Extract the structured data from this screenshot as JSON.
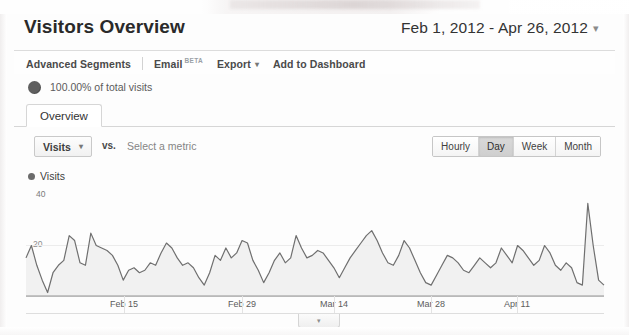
{
  "header": {
    "title": "Visitors Overview",
    "date_range": "Feb 1, 2012 - Apr 26, 2012",
    "date_caret": "▾"
  },
  "toolbar": {
    "advanced_segments": "Advanced Segments",
    "email": "Email",
    "email_badge": "BETA",
    "export": "Export",
    "export_caret": "▾",
    "add_to_dashboard": "Add to Dashboard"
  },
  "segment": {
    "icon": "pie-chart-icon",
    "label": "100.00% of total visits"
  },
  "tabs": [
    {
      "label": "Overview",
      "active": true
    }
  ],
  "metric_row": {
    "metric_button": "Visits",
    "metric_caret": "▾",
    "vs_label": "vs.",
    "select_metric_placeholder": "Select a metric"
  },
  "granularity": {
    "options": [
      "Hourly",
      "Day",
      "Week",
      "Month"
    ],
    "selected": "Day"
  },
  "legend": {
    "series_name": "Visits",
    "dot_color": "#6b6b6b"
  },
  "collapse_handle": {
    "icon": "chevron-down-icon",
    "glyph": "▾"
  },
  "chart_data": {
    "type": "area",
    "title": "Visits",
    "xlabel": "",
    "ylabel": "Visits",
    "ylim": [
      0,
      40
    ],
    "grid": false,
    "legend_position": "top-left",
    "y_ticks": [
      40,
      20
    ],
    "y_tick_labels": [
      "40",
      "20"
    ],
    "x_tick_labels": [
      "Feb 15",
      "Feb 29",
      "Mar 14",
      "Mar 28",
      "Apr 11"
    ],
    "x_tick_positions": [
      110,
      228,
      320,
      417,
      503
    ],
    "line_color": "#6f6f6f",
    "fill_color": "#eeeeee",
    "series": [
      {
        "name": "Visits",
        "values": [
          15,
          20,
          12,
          6,
          1,
          9,
          12,
          14,
          24,
          22,
          13,
          12,
          25,
          20,
          19,
          18,
          16,
          12,
          6,
          10,
          11,
          9,
          10,
          13,
          12,
          17,
          21,
          19,
          15,
          12,
          13,
          11,
          7,
          4,
          9,
          16,
          14,
          19,
          15,
          17,
          22,
          21,
          14,
          10,
          5,
          9,
          14,
          17,
          13,
          15,
          24,
          19,
          15,
          16,
          18,
          17,
          14,
          11,
          7,
          11,
          15,
          18,
          21,
          24,
          26,
          22,
          17,
          13,
          12,
          16,
          22,
          19,
          14,
          9,
          5,
          4,
          8,
          12,
          16,
          15,
          13,
          10,
          9,
          12,
          15,
          13,
          11,
          13,
          19,
          16,
          13,
          20,
          18,
          15,
          12,
          14,
          20,
          17,
          12,
          10,
          13,
          11,
          5,
          4,
          37,
          20,
          6,
          4
        ]
      }
    ]
  }
}
